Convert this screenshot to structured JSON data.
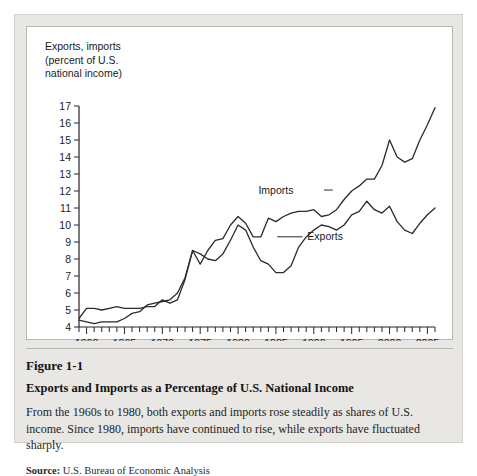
{
  "figure": {
    "number": "Figure 1-1",
    "title": "Exports and Imports as a Percentage of U.S. National Income",
    "description": "From the 1960s to 1980, both exports and imports rose steadily as shares of U.S. income. Since 1980, imports have continued to rise, while exports have fluctuated sharply.",
    "source_label": "Source:",
    "source_text": "U.S. Bureau of Economic Analysis"
  },
  "chart_data": {
    "type": "line",
    "title": "",
    "ylabel": "Exports, imports\n(percent of U.S.\nnational income)",
    "xlabel": "",
    "ylim": [
      4,
      17
    ],
    "xlim": [
      1959,
      2006
    ],
    "grid": false,
    "legend_position": "inline-annotation",
    "yticks": [
      4,
      5,
      6,
      7,
      8,
      9,
      10,
      11,
      12,
      13,
      14,
      15,
      16,
      17
    ],
    "ytick_labels": [
      "4",
      "5",
      "6",
      "7",
      "8",
      "9",
      "10",
      "11",
      "12",
      "13",
      "14",
      "15",
      "16",
      "17"
    ],
    "xticks": [
      1960,
      1965,
      1970,
      1975,
      1980,
      1985,
      1990,
      1995,
      2000,
      2005
    ],
    "xtick_labels": [
      "1960",
      "1965",
      "1970",
      "1975",
      "1980",
      "1985",
      "1990",
      "1995",
      "2000",
      "2005"
    ],
    "x_minor_tick_interval": 1,
    "x": [
      1959,
      1960,
      1961,
      1962,
      1963,
      1964,
      1965,
      1966,
      1967,
      1968,
      1969,
      1970,
      1971,
      1972,
      1973,
      1974,
      1975,
      1976,
      1977,
      1978,
      1979,
      1980,
      1981,
      1982,
      1983,
      1984,
      1985,
      1986,
      1987,
      1988,
      1989,
      1990,
      1991,
      1992,
      1993,
      1994,
      1995,
      1996,
      1997,
      1998,
      1999,
      2000,
      2001,
      2002,
      2003,
      2004,
      2005,
      2006
    ],
    "series": [
      {
        "name": "Exports",
        "label": "Exports",
        "color": "#2b2b2b",
        "values": [
          4.5,
          5.1,
          5.1,
          5.0,
          5.1,
          5.2,
          5.1,
          5.1,
          5.1,
          5.2,
          5.2,
          5.6,
          5.4,
          5.6,
          6.8,
          8.5,
          8.3,
          8.0,
          7.9,
          8.3,
          9.1,
          10.0,
          9.7,
          8.7,
          7.9,
          7.7,
          7.2,
          7.2,
          7.6,
          8.7,
          9.3,
          9.7,
          10.0,
          9.9,
          9.7,
          10.0,
          10.6,
          10.8,
          11.4,
          10.9,
          10.7,
          11.1,
          10.2,
          9.7,
          9.5,
          10.1,
          10.6,
          11.0
        ],
        "marker": "none",
        "linewidth": 1.3
      },
      {
        "name": "Imports",
        "label": "Imports",
        "color": "#2b2b2b",
        "values": [
          4.4,
          4.3,
          4.2,
          4.3,
          4.3,
          4.3,
          4.5,
          4.8,
          4.9,
          5.3,
          5.4,
          5.5,
          5.6,
          6.0,
          6.9,
          8.5,
          7.7,
          8.5,
          9.1,
          9.2,
          10.0,
          10.5,
          10.1,
          9.3,
          9.3,
          10.4,
          10.2,
          10.5,
          10.7,
          10.8,
          10.8,
          10.9,
          10.5,
          10.6,
          10.9,
          11.5,
          12.0,
          12.3,
          12.7,
          12.7,
          13.5,
          15.0,
          14.0,
          13.7,
          13.9,
          15.0,
          15.9,
          16.9
        ],
        "marker": "none",
        "linewidth": 1.3
      }
    ],
    "annotations": [
      {
        "text": "Imports",
        "x": 1985.0,
        "y": 11.85,
        "leader_to_x": 1992.5,
        "leader_to_y": 11.85
      },
      {
        "text": "Exports",
        "x": 1991.5,
        "y": 9.1,
        "leader_to_x": 1988.5,
        "leader_to_y": 9.1
      }
    ]
  }
}
